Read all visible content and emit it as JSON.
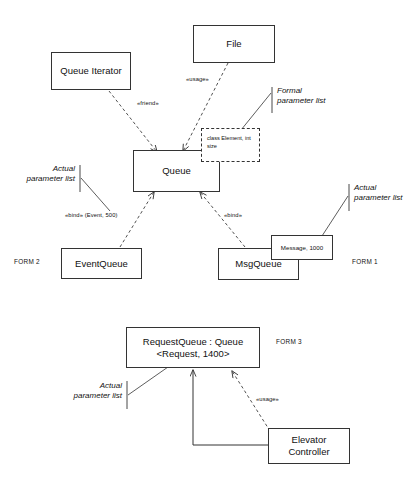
{
  "diagram": {
    "stroke_color": "#333333",
    "background": "#ffffff"
  },
  "classes": {
    "queue_iterator": {
      "name": "Queue Iterator"
    },
    "file": {
      "name": "File"
    },
    "queue": {
      "name": "Queue"
    },
    "event_queue": {
      "name": "EventQueue"
    },
    "msg_queue": {
      "name": "MsgQueue"
    },
    "message_binding": {
      "name": "Message, 1000"
    },
    "request_queue": {
      "line1": "RequestQueue : Queue",
      "line2": "<Request, 1400>"
    },
    "elevator_controller": {
      "line1": "Elevator",
      "line2": "Controller"
    }
  },
  "formal_parameters": {
    "line1": "class Element,",
    "line2": "int size"
  },
  "stereotypes": {
    "friend": "«friend»",
    "usage_top": "«usage»",
    "bind_event": "«bind» (Event, 500)",
    "bind_msg": "«bind»",
    "usage_bottom": "«usage»"
  },
  "annotations": {
    "formal_parameter_list": {
      "line1": "Formal",
      "line2": "parameter list"
    },
    "actual_parameter_list_left": {
      "line1": "Actual",
      "line2": "parameter list"
    },
    "actual_parameter_list_right": {
      "line1": "Actual",
      "line2": "parameter list"
    },
    "actual_parameter_list_bottom": {
      "line1": "Actual",
      "line2": "parameter list"
    }
  },
  "form_tags": {
    "form1": "FORM 1",
    "form2": "FORM 2",
    "form3": "FORM 3"
  }
}
